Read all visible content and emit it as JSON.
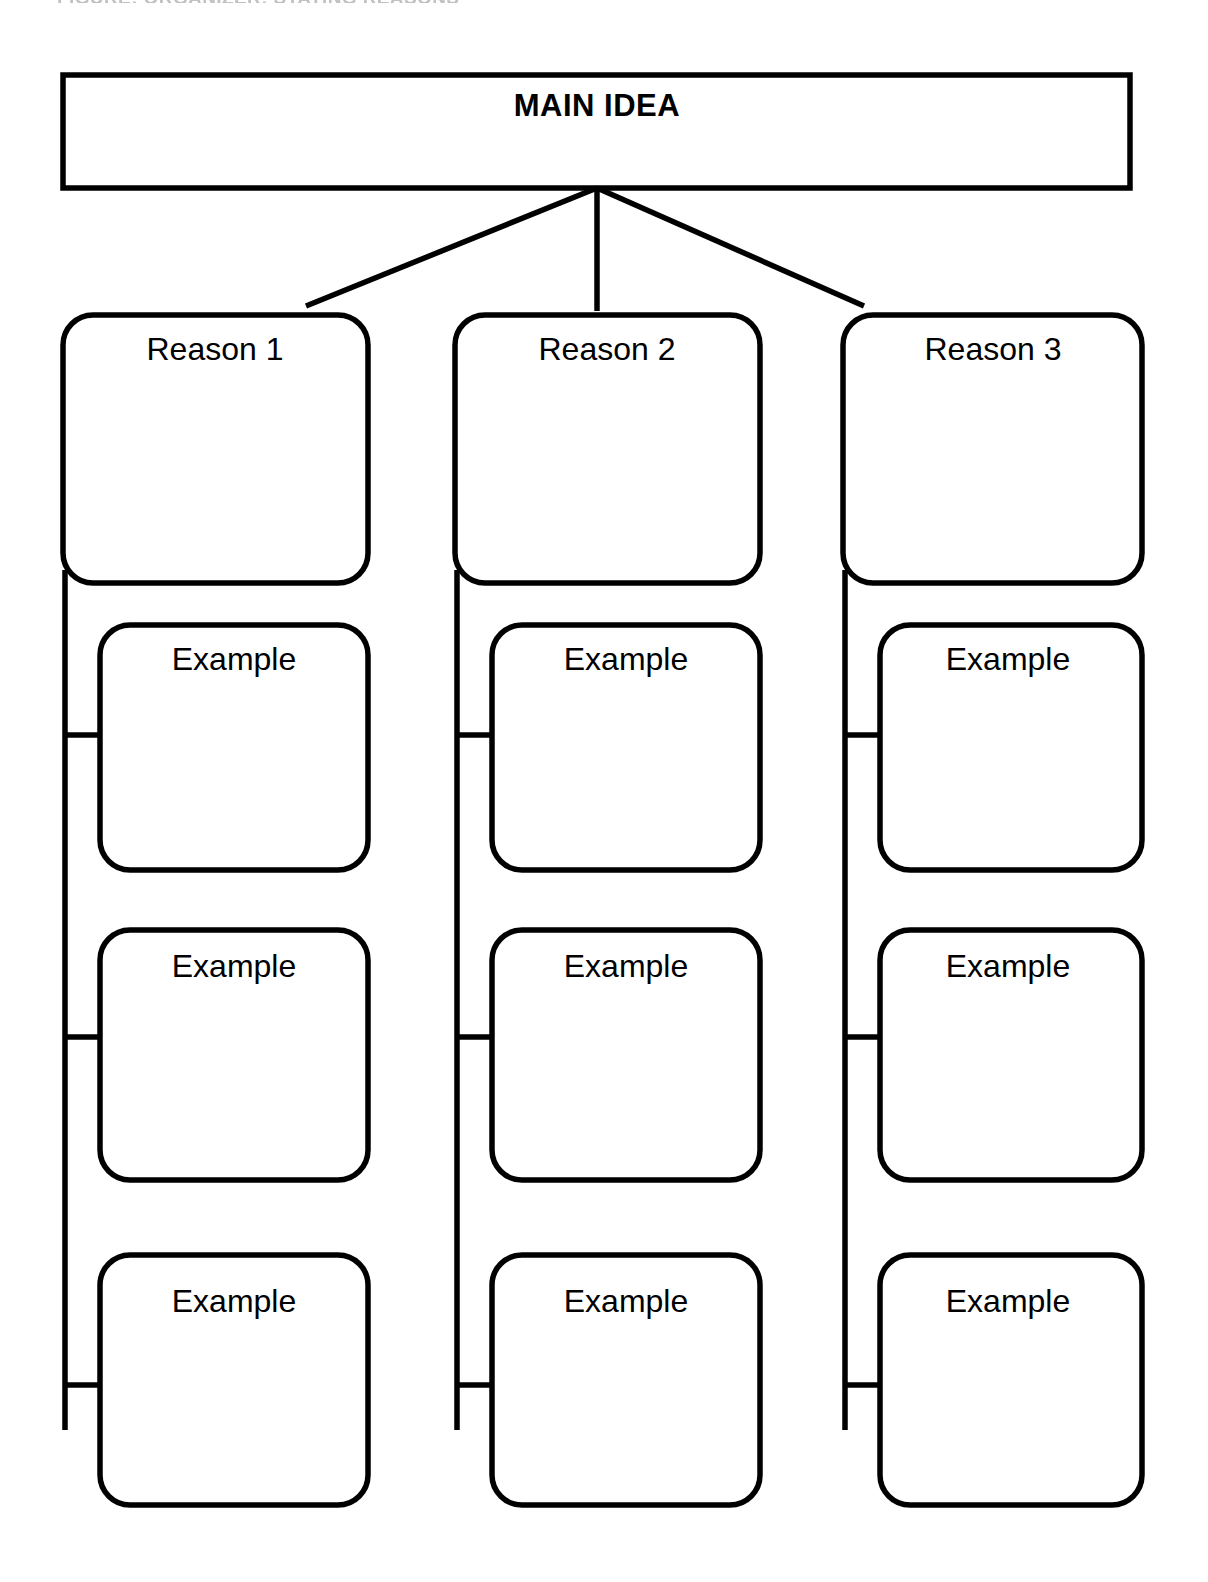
{
  "page": {
    "width": 1208,
    "height": 1582,
    "background": "#ffffff",
    "ink_color": "#000000",
    "header_caption": "FIGURE: ORGANIZER: STATING REASONS"
  },
  "organizer": {
    "title": "Stating Reasons Graphic Organizer",
    "main_idea": {
      "label": "MAIN IDEA",
      "bold": true
    },
    "columns": [
      {
        "reason": {
          "label": "Reason 1"
        },
        "examples": [
          {
            "label": "Example"
          },
          {
            "label": "Example"
          },
          {
            "label": "Example"
          }
        ]
      },
      {
        "reason": {
          "label": "Reason 2"
        },
        "examples": [
          {
            "label": "Example"
          },
          {
            "label": "Example"
          },
          {
            "label": "Example"
          }
        ]
      },
      {
        "reason": {
          "label": "Reason 3"
        },
        "examples": [
          {
            "label": "Example"
          },
          {
            "label": "Example"
          },
          {
            "label": "Example"
          }
        ]
      }
    ]
  },
  "geometry": {
    "main_box": {
      "x": 63,
      "y": 75,
      "w": 1067,
      "h": 113
    },
    "hub": {
      "x": 597,
      "y": 188
    },
    "reason_row": {
      "y": 315,
      "h": 268,
      "w": 305
    },
    "column_x": [
      63,
      455,
      843
    ],
    "example_offset_x": 37,
    "example_rows": [
      {
        "y": 625,
        "h": 245
      },
      {
        "y": 930,
        "h": 250
      },
      {
        "y": 1255,
        "h": 250
      }
    ],
    "spine": {
      "y_start": 570,
      "y_end": 1430
    },
    "stub_y": [
      735,
      1037,
      1385
    ],
    "stub_length": 37,
    "corner_radius": 30,
    "stroke_width": 5.5
  }
}
